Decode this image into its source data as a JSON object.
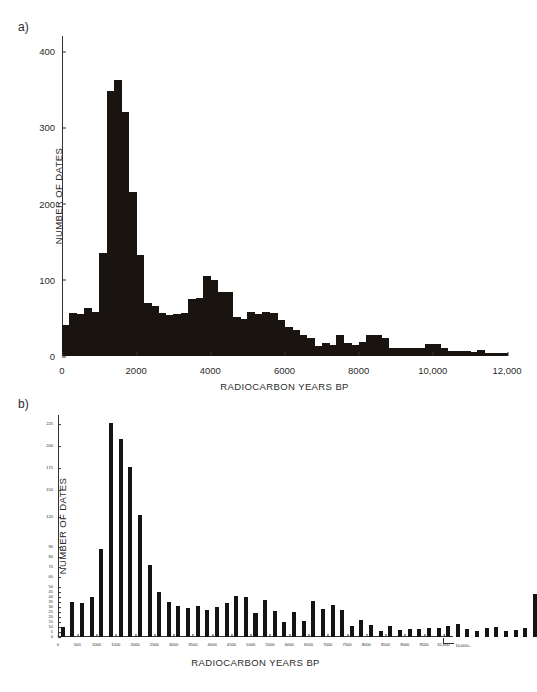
{
  "figure": {
    "panels": [
      {
        "label": "a)"
      },
      {
        "label": "b)"
      }
    ]
  },
  "chart_data": [
    {
      "id": "panel-a",
      "type": "bar",
      "title": "",
      "panel_label": "a)",
      "xlabel": "RADIOCARBON YEARS BP",
      "ylabel": "NUMBER OF DATES",
      "xlim": [
        0,
        12000
      ],
      "ylim": [
        0,
        420
      ],
      "bin_width": 200,
      "grid": false,
      "legend": null,
      "xticks": [
        0,
        2000,
        4000,
        6000,
        8000,
        10000,
        12000
      ],
      "xticklabels": [
        "0",
        "2000",
        "4000",
        "6000",
        "8000",
        "10,000",
        "12,000"
      ],
      "yticks": [
        0,
        100,
        200,
        300,
        400
      ],
      "yticklabels": [
        "0",
        "100",
        "200",
        "300",
        "400"
      ],
      "x": [
        0,
        200,
        400,
        600,
        800,
        1000,
        1200,
        1400,
        1600,
        1800,
        2000,
        2200,
        2400,
        2600,
        2800,
        3000,
        3200,
        3400,
        3600,
        3800,
        4000,
        4200,
        4400,
        4600,
        4800,
        5000,
        5200,
        5400,
        5600,
        5800,
        6000,
        6200,
        6400,
        6600,
        6800,
        7000,
        7200,
        7400,
        7600,
        7800,
        8000,
        8200,
        8400,
        8600,
        8800,
        9000,
        9200,
        9400,
        9600,
        9800,
        10000,
        10200,
        10400,
        10600,
        10800,
        11000,
        11200,
        11400,
        11600,
        11800
      ],
      "values": [
        41,
        56,
        55,
        63,
        58,
        135,
        348,
        362,
        320,
        215,
        133,
        70,
        66,
        57,
        54,
        55,
        56,
        75,
        76,
        105,
        100,
        84,
        84,
        51,
        48,
        58,
        55,
        58,
        57,
        47,
        38,
        34,
        28,
        24,
        13,
        17,
        15,
        27,
        17,
        15,
        19,
        27,
        27,
        23,
        10,
        10,
        10,
        11,
        10,
        16,
        16,
        11,
        7,
        6,
        6,
        5,
        8,
        4,
        4,
        4
      ]
    },
    {
      "id": "panel-b",
      "type": "bar",
      "title": "",
      "panel_label": "b)",
      "xlabel": "RADIOCARBON YEARS BP",
      "ylabel": "NUMBER OF DATES",
      "xlim": [
        0,
        10250
      ],
      "ylim": [
        0,
        232
      ],
      "bin_width": 250,
      "grid": false,
      "legend": null,
      "xticks": [
        0,
        500,
        1000,
        1500,
        2000,
        2500,
        3000,
        3500,
        4000,
        4500,
        5000,
        5500,
        6000,
        6500,
        7000,
        7500,
        8000,
        8500,
        9000,
        9500,
        10000
      ],
      "xticklabels": [
        "0",
        "500",
        "1000",
        "1500",
        "2000",
        "2500",
        "3000",
        "3500",
        "4000",
        "4500",
        "5000",
        "5500",
        "6000",
        "6500",
        "7000",
        "7500",
        "8000",
        "8500",
        "9000",
        "9500",
        "10,000"
      ],
      "overflow_label": "10,000+",
      "yticks": [
        0,
        5,
        10,
        15,
        20,
        25,
        30,
        35,
        40,
        45,
        50,
        60,
        70,
        80,
        90,
        120,
        150,
        175,
        200,
        225
      ],
      "yticklabels": [
        "0",
        "5",
        "10",
        "15",
        "20",
        "25",
        "30",
        "35",
        "40",
        "45",
        "50",
        "60",
        "70",
        "80",
        "90",
        "120",
        "150",
        "175",
        "200",
        "225"
      ],
      "categories": [
        "250",
        "500",
        "750",
        "1000",
        "1250",
        "1500",
        "1750",
        "2000",
        "2250",
        "2500",
        "2750",
        "3000",
        "3250",
        "3500",
        "3750",
        "4000",
        "4250",
        "4500",
        "4750",
        "5000",
        "5250",
        "5500",
        "5750",
        "6000",
        "6250",
        "6500",
        "6750",
        "7000",
        "7250",
        "7500",
        "7750",
        "8000",
        "8250",
        "8500",
        "8750",
        "9000",
        "9250",
        "9500",
        "9750",
        "10000",
        "10000+"
      ],
      "values": [
        10,
        35,
        34,
        40,
        88,
        226,
        208,
        176,
        122,
        72,
        45,
        35,
        31,
        29,
        31,
        27,
        30,
        34,
        41,
        40,
        24,
        37,
        26,
        15,
        25,
        16,
        36,
        28,
        32,
        27,
        11,
        17,
        12,
        6,
        11,
        7,
        8,
        8,
        9,
        9,
        11,
        13,
        8,
        6,
        9,
        10,
        6,
        7,
        9,
        43
      ]
    }
  ]
}
